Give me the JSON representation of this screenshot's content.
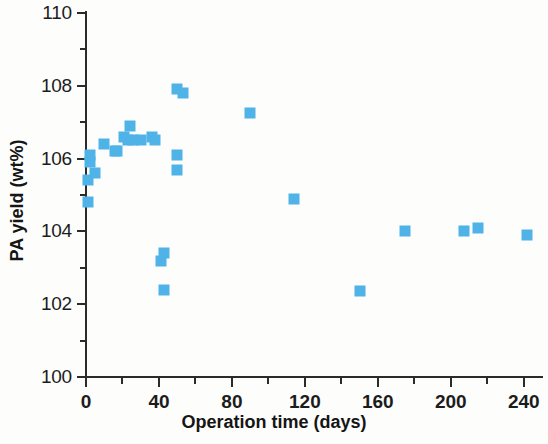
{
  "chart_data": {
    "type": "scatter",
    "title": "",
    "xlabel": "Operation time (days)",
    "ylabel": "PA yield (wt%)",
    "xlim": [
      0,
      250
    ],
    "ylim": [
      100,
      110
    ],
    "xticks": [
      0,
      40,
      80,
      120,
      160,
      200,
      240
    ],
    "xticklabels": [
      "0",
      "40",
      "80",
      "120",
      "160",
      "200",
      "240"
    ],
    "xminorticks": [
      20,
      60,
      100,
      140,
      180,
      220
    ],
    "yticks": [
      100,
      102,
      104,
      106,
      108,
      110
    ],
    "yticklabels": [
      "100",
      "102",
      "104",
      "106",
      "108",
      "110"
    ],
    "yminorticks": [
      101,
      103,
      105,
      107,
      109
    ],
    "grid": false,
    "legend": false,
    "marker": "square",
    "marker_color": "#4fb3e8",
    "series": [
      {
        "name": "PA yield",
        "points": [
          {
            "x": 1,
            "y": 104.8
          },
          {
            "x": 1,
            "y": 105.4
          },
          {
            "x": 2,
            "y": 105.9
          },
          {
            "x": 2,
            "y": 106.1
          },
          {
            "x": 5,
            "y": 105.6
          },
          {
            "x": 10,
            "y": 106.4
          },
          {
            "x": 16,
            "y": 106.2
          },
          {
            "x": 17,
            "y": 106.2
          },
          {
            "x": 21,
            "y": 106.6
          },
          {
            "x": 23,
            "y": 106.5
          },
          {
            "x": 24,
            "y": 106.9
          },
          {
            "x": 26,
            "y": 106.5
          },
          {
            "x": 30,
            "y": 106.5
          },
          {
            "x": 36,
            "y": 106.6
          },
          {
            "x": 38,
            "y": 106.5
          },
          {
            "x": 41,
            "y": 103.2
          },
          {
            "x": 43,
            "y": 103.4
          },
          {
            "x": 43,
            "y": 102.4
          },
          {
            "x": 50,
            "y": 106.1
          },
          {
            "x": 50,
            "y": 105.7
          },
          {
            "x": 50,
            "y": 107.9
          },
          {
            "x": 53,
            "y": 107.8
          },
          {
            "x": 90,
            "y": 107.25
          },
          {
            "x": 114,
            "y": 104.9
          },
          {
            "x": 150,
            "y": 102.35
          },
          {
            "x": 175,
            "y": 104.0
          },
          {
            "x": 207,
            "y": 104.0
          },
          {
            "x": 215,
            "y": 104.1
          },
          {
            "x": 242,
            "y": 103.9
          }
        ]
      }
    ]
  }
}
